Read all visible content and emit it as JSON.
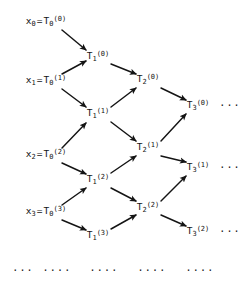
{
  "figure": {
    "ink_color": "#141414",
    "background_color": "#ffffff",
    "width": 244,
    "height": 288
  },
  "nodes": [
    {
      "id": "x0",
      "text": "x₀ = T₀⁽⁰⁾",
      "base": "x",
      "sub": "0",
      "eq": "=",
      "tbase": "T",
      "tsub": "0",
      "tsup": "(0)",
      "x": 46,
      "y": 22,
      "kind": "input"
    },
    {
      "id": "x1",
      "text": "x₁ = T₀⁽¹⁾",
      "base": "x",
      "sub": "1",
      "eq": "=",
      "tbase": "T",
      "tsub": "0",
      "tsup": "(1)",
      "x": 46,
      "y": 81,
      "kind": "input"
    },
    {
      "id": "x2",
      "text": "x₂ = T₀⁽²⁾",
      "base": "x",
      "sub": "2",
      "eq": "=",
      "tbase": "T",
      "tsub": "0",
      "tsup": "(2)",
      "x": 46,
      "y": 155,
      "kind": "input"
    },
    {
      "id": "x3",
      "text": "x₃ = T₀⁽³⁾",
      "base": "x",
      "sub": "3",
      "eq": "=",
      "tbase": "T",
      "tsub": "0",
      "tsup": "(3)",
      "x": 46,
      "y": 212,
      "kind": "input"
    },
    {
      "id": "T1_0",
      "base": "T",
      "sub": "1",
      "sup": "(0)",
      "x": 98,
      "y": 57,
      "kind": "tableau"
    },
    {
      "id": "T1_1",
      "base": "T",
      "sub": "1",
      "sup": "(1)",
      "x": 98,
      "y": 114,
      "kind": "tableau"
    },
    {
      "id": "T1_2",
      "base": "T",
      "sub": "1",
      "sup": "(2)",
      "x": 98,
      "y": 180,
      "kind": "tableau"
    },
    {
      "id": "T1_3",
      "base": "T",
      "sub": "1",
      "sup": "(3)",
      "x": 98,
      "y": 236,
      "kind": "tableau"
    },
    {
      "id": "T2_0",
      "base": "T",
      "sub": "2",
      "sup": "(0)",
      "x": 148,
      "y": 80,
      "kind": "tableau"
    },
    {
      "id": "T2_1",
      "base": "T",
      "sub": "2",
      "sup": "(1)",
      "x": 148,
      "y": 148,
      "kind": "tableau"
    },
    {
      "id": "T2_2",
      "base": "T",
      "sub": "2",
      "sup": "(2)",
      "x": 148,
      "y": 208,
      "kind": "tableau"
    },
    {
      "id": "T3_0",
      "base": "T",
      "sub": "3",
      "sup": "(0)",
      "x": 198,
      "y": 106,
      "kind": "tableau"
    },
    {
      "id": "T3_1",
      "base": "T",
      "sub": "3",
      "sup": "(1)",
      "x": 198,
      "y": 168,
      "kind": "tableau"
    },
    {
      "id": "T3_2",
      "base": "T",
      "sub": "3",
      "sup": "(2)",
      "x": 198,
      "y": 232,
      "kind": "tableau"
    }
  ],
  "ellipses": [
    {
      "id": "e-row0",
      "text": "···",
      "x": 230,
      "y": 106
    },
    {
      "id": "e-row1",
      "text": "···",
      "x": 230,
      "y": 168
    },
    {
      "id": "e-row2",
      "text": "···",
      "x": 230,
      "y": 232
    },
    {
      "id": "e-bot0",
      "text": "···",
      "x": 23,
      "y": 271
    },
    {
      "id": "e-bot1",
      "text": "····",
      "x": 57,
      "y": 271
    },
    {
      "id": "e-bot2",
      "text": "····",
      "x": 104,
      "y": 271
    },
    {
      "id": "e-bot3",
      "text": "····",
      "x": 152,
      "y": 271
    },
    {
      "id": "e-bot4",
      "text": "····",
      "x": 200,
      "y": 271
    }
  ],
  "arrows": [
    {
      "id": "a-x0-T1_0",
      "from": "x0",
      "to": "T1_0",
      "x1": 62,
      "y1": 30,
      "x2": 86,
      "y2": 50
    },
    {
      "id": "a-x1-T1_0",
      "from": "x1",
      "to": "T1_0",
      "x1": 62,
      "y1": 74,
      "x2": 86,
      "y2": 61
    },
    {
      "id": "a-x1-T1_1",
      "from": "x1",
      "to": "T1_1",
      "x1": 62,
      "y1": 89,
      "x2": 86,
      "y2": 107
    },
    {
      "id": "a-x2-T1_1",
      "from": "x2",
      "to": "T1_1",
      "x1": 62,
      "y1": 148,
      "x2": 86,
      "y2": 123
    },
    {
      "id": "a-x2-T1_2",
      "from": "x2",
      "to": "T1_2",
      "x1": 62,
      "y1": 163,
      "x2": 86,
      "y2": 174
    },
    {
      "id": "a-x3-T1_2",
      "from": "x3",
      "to": "T1_2",
      "x1": 62,
      "y1": 205,
      "x2": 86,
      "y2": 188
    },
    {
      "id": "a-x3-T1_3",
      "from": "x3",
      "to": "T1_3",
      "x1": 62,
      "y1": 220,
      "x2": 86,
      "y2": 230
    },
    {
      "id": "a-T10-T20",
      "from": "T1_0",
      "to": "T2_0",
      "x1": 111,
      "y1": 64,
      "x2": 136,
      "y2": 74
    },
    {
      "id": "a-T11-T20",
      "from": "T1_1",
      "to": "T2_0",
      "x1": 111,
      "y1": 107,
      "x2": 136,
      "y2": 88
    },
    {
      "id": "a-T11-T21",
      "from": "T1_1",
      "to": "T2_1",
      "x1": 111,
      "y1": 122,
      "x2": 136,
      "y2": 141
    },
    {
      "id": "a-T12-T21",
      "from": "T1_2",
      "to": "T2_1",
      "x1": 111,
      "y1": 173,
      "x2": 136,
      "y2": 156
    },
    {
      "id": "a-T12-T22",
      "from": "T1_2",
      "to": "T2_2",
      "x1": 111,
      "y1": 188,
      "x2": 136,
      "y2": 201
    },
    {
      "id": "a-T13-T22",
      "from": "T1_3",
      "to": "T2_2",
      "x1": 111,
      "y1": 229,
      "x2": 136,
      "y2": 215
    },
    {
      "id": "a-T20-T30",
      "from": "T2_0",
      "to": "T3_0",
      "x1": 161,
      "y1": 88,
      "x2": 186,
      "y2": 100
    },
    {
      "id": "a-T21-T30",
      "from": "T2_1",
      "to": "T3_0",
      "x1": 161,
      "y1": 141,
      "x2": 186,
      "y2": 114
    },
    {
      "id": "a-T21-T31",
      "from": "T2_1",
      "to": "T3_1",
      "x1": 161,
      "y1": 156,
      "x2": 186,
      "y2": 162
    },
    {
      "id": "a-T22-T31",
      "from": "T2_2",
      "to": "T3_1",
      "x1": 161,
      "y1": 201,
      "x2": 186,
      "y2": 176
    },
    {
      "id": "a-T22-T32",
      "from": "T2_2",
      "to": "T3_2",
      "x1": 161,
      "y1": 215,
      "x2": 186,
      "y2": 226
    }
  ]
}
